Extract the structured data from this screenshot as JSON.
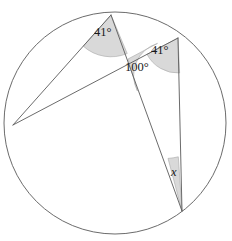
{
  "figure": {
    "background_color": "#ffffff",
    "stroke_color": "#5a5a5a",
    "shade_fill": "#d9d9d9",
    "shade_stroke": "#9a9a9a",
    "text_color": "#1a1a1a"
  },
  "circle": {
    "center_x": 115,
    "center_y": 123,
    "radius": 111
  },
  "points": {
    "top": {
      "name": "top-vertex",
      "x": 111,
      "y": 15
    },
    "upper_right": {
      "name": "upper-right-vertex",
      "x": 178,
      "y": 38
    },
    "left": {
      "name": "left-vertex",
      "x": 13,
      "y": 125
    },
    "bottom": {
      "name": "bottom-vertex",
      "x": 182,
      "y": 211
    },
    "intersection": {
      "name": "chord-intersection",
      "x": 128,
      "y": 59
    }
  },
  "chords": [
    {
      "name": "chord-top-to-left",
      "from": "top",
      "to": "left"
    },
    {
      "name": "chord-left-to-upper-right",
      "from": "left",
      "to": "upper_right"
    },
    {
      "name": "chord-top-to-bottom",
      "from": "top",
      "to": "bottom"
    },
    {
      "name": "chord-upper-right-to-bottom",
      "from": "upper_right",
      "to": "bottom"
    }
  ],
  "angles": [
    {
      "name": "angle-at-top-vertex",
      "label": "41°",
      "value": 41,
      "unit": "degrees",
      "vertex": "top",
      "shaded": true
    },
    {
      "name": "angle-at-upper-right-vertex",
      "label": "41°",
      "value": 41,
      "unit": "degrees",
      "vertex": "upper_right",
      "shaded": true
    },
    {
      "name": "angle-at-intersection",
      "label": "100°",
      "value": 100,
      "unit": "degrees",
      "vertex": "intersection",
      "shaded": true
    },
    {
      "name": "angle-unknown-at-bottom-vertex",
      "label": "x",
      "value": null,
      "unit": "degrees",
      "vertex": "bottom",
      "shaded": true
    }
  ]
}
